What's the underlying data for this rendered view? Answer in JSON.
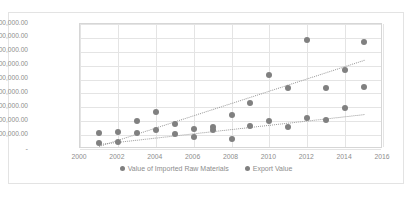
{
  "chart_data": {
    "type": "scatter",
    "title": "",
    "xlabel": "",
    "ylabel": "",
    "xlim": [
      2000,
      2016
    ],
    "ylim": [
      0,
      9000000
    ],
    "xticks": [
      "2000",
      "2002",
      "2004",
      "2006",
      "2008",
      "2010",
      "2012",
      "2014",
      "2016"
    ],
    "xtick_values": [
      2000,
      2002,
      2004,
      2006,
      2008,
      2010,
      2012,
      2014,
      2016
    ],
    "yticks": [
      "-",
      "1,000,000.00",
      "2,000,000.00",
      "3,000,000.00",
      "4,000,000.00",
      "5,000,000.00",
      "6,000,000.00",
      "7,000,000.00",
      "8,000,000.00",
      "9,000,000.00"
    ],
    "ytick_values": [
      0,
      1000000,
      2000000,
      3000000,
      4000000,
      5000000,
      6000000,
      7000000,
      8000000,
      9000000
    ],
    "grid": true,
    "legend_position": "bottom",
    "marker_color": "#808080",
    "trendline_color": "#9a9a9a",
    "series": [
      {
        "name": "Value of Imported Raw Materials",
        "color": "#808080",
        "trendline": {
          "type": "linear",
          "x0": 2001,
          "y0": 250000,
          "x1": 2015,
          "y1": 6450000
        },
        "points": [
          {
            "x": 2001,
            "y": 1150000
          },
          {
            "x": 2002,
            "y": 1250000
          },
          {
            "x": 2003,
            "y": 2000000
          },
          {
            "x": 2004,
            "y": 2700000
          },
          {
            "x": 2005,
            "y": 1800000
          },
          {
            "x": 2006,
            "y": 1450000
          },
          {
            "x": 2007,
            "y": 1600000
          },
          {
            "x": 2008,
            "y": 2450000
          },
          {
            "x": 2009,
            "y": 3300000
          },
          {
            "x": 2010,
            "y": 5350000
          },
          {
            "x": 2011,
            "y": 4400000
          },
          {
            "x": 2012,
            "y": 7850000
          },
          {
            "x": 2013,
            "y": 4400000
          },
          {
            "x": 2014,
            "y": 5700000
          },
          {
            "x": 2015,
            "y": 7700000
          }
        ]
      },
      {
        "name": "Export Value",
        "color": "#808080",
        "trendline": {
          "type": "linear",
          "x0": 2001,
          "y0": 350000,
          "x1": 2015,
          "y1": 2500000
        },
        "points": [
          {
            "x": 2001,
            "y": 450000
          },
          {
            "x": 2002,
            "y": 500000
          },
          {
            "x": 2003,
            "y": 1150000
          },
          {
            "x": 2004,
            "y": 1400000
          },
          {
            "x": 2005,
            "y": 1100000
          },
          {
            "x": 2006,
            "y": 900000
          },
          {
            "x": 2007,
            "y": 1400000
          },
          {
            "x": 2008,
            "y": 700000
          },
          {
            "x": 2009,
            "y": 1650000
          },
          {
            "x": 2010,
            "y": 2000000
          },
          {
            "x": 2011,
            "y": 1550000
          },
          {
            "x": 2012,
            "y": 2250000
          },
          {
            "x": 2013,
            "y": 2100000
          },
          {
            "x": 2014,
            "y": 2950000
          },
          {
            "x": 2015,
            "y": 4500000
          }
        ]
      }
    ]
  },
  "legend": {
    "items": [
      {
        "label": "Value of Imported Raw Materials"
      },
      {
        "label": "Export Value"
      }
    ]
  }
}
